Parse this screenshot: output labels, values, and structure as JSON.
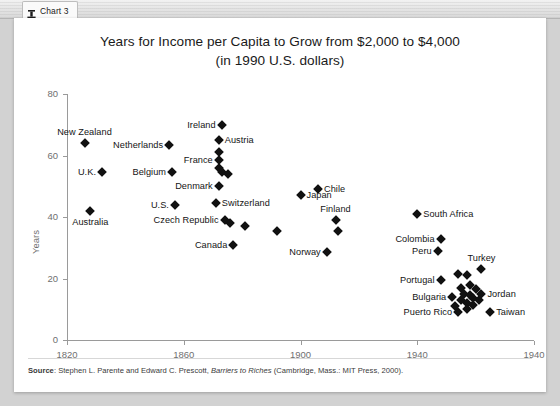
{
  "window": {
    "tab_label": "Chart 3",
    "tab_icon": "chart-icon"
  },
  "chart_data": {
    "type": "scatter",
    "title_line1": "Years for Income per Capita to Grow from $2,000 to $4,000",
    "title_line2": "(in 1990 U.S. dollars)",
    "xlabel": "",
    "ylabel": "Years",
    "xlim": [
      1820,
      1980
    ],
    "ylim": [
      0,
      80
    ],
    "xticks": [
      "1820",
      "1860",
      "1900",
      "1940",
      "1940"
    ],
    "xtick_values": [
      1820,
      1860,
      1900,
      1940,
      1980
    ],
    "yticks": [
      "0",
      "20",
      "40",
      "60",
      "80"
    ],
    "ytick_values": [
      0,
      20,
      40,
      60,
      80
    ],
    "grid": false,
    "legend": "none",
    "marker": "diamond",
    "marker_color": "#111111",
    "points": [
      {
        "name": "New Zealand",
        "x": 1826,
        "y": 64,
        "label_pos": "above"
      },
      {
        "name": "Netherlands",
        "x": 1855,
        "y": 63.5,
        "label_pos": "right"
      },
      {
        "name": "U.K.",
        "x": 1832,
        "y": 54.5,
        "label_pos": "right"
      },
      {
        "name": "Belgium",
        "x": 1856,
        "y": 54.5,
        "label_pos": "right"
      },
      {
        "name": "Australia",
        "x": 1828,
        "y": 42,
        "label_pos": "below"
      },
      {
        "name": "U.S.",
        "x": 1857,
        "y": 44,
        "label_pos": "right"
      },
      {
        "name": "Ireland",
        "x": 1873,
        "y": 70,
        "label_pos": "right"
      },
      {
        "name": "Austria",
        "x": 1872,
        "y": 65,
        "label_pos": "left"
      },
      {
        "name": "France",
        "x": 1872,
        "y": 58.5,
        "label_pos": "right"
      },
      {
        "name": "Denmark",
        "x": 1872,
        "y": 50,
        "label_pos": "right"
      },
      {
        "name": "Switzerland",
        "x": 1871,
        "y": 44.5,
        "label_pos": "left"
      },
      {
        "name": "Czech Republic",
        "x": 1874,
        "y": 39,
        "label_pos": "right"
      },
      {
        "name": "Canada",
        "x": 1877,
        "y": 31,
        "label_pos": "right"
      },
      {
        "name": "Japan",
        "x": 1900,
        "y": 47,
        "label_pos": "left"
      },
      {
        "name": "Chile",
        "x": 1906,
        "y": 49,
        "label_pos": "left"
      },
      {
        "name": "Finland",
        "x": 1912,
        "y": 39,
        "label_pos": "above"
      },
      {
        "name": "Norway",
        "x": 1909,
        "y": 28.5,
        "label_pos": "right"
      },
      {
        "name": "South Africa",
        "x": 1940,
        "y": 41,
        "label_pos": "left"
      },
      {
        "name": "Colombia",
        "x": 1948,
        "y": 33,
        "label_pos": "right"
      },
      {
        "name": "Peru",
        "x": 1947,
        "y": 29,
        "label_pos": "right"
      },
      {
        "name": "Turkey",
        "x": 1962,
        "y": 23,
        "label_pos": "above"
      },
      {
        "name": "Portugal",
        "x": 1948,
        "y": 19.5,
        "label_pos": "right"
      },
      {
        "name": "Bulgaria",
        "x": 1952,
        "y": 14,
        "label_pos": "right"
      },
      {
        "name": "Jordan",
        "x": 1962,
        "y": 15,
        "label_pos": "left"
      },
      {
        "name": "Puerto Rico",
        "x": 1954,
        "y": 9,
        "label_pos": "right"
      },
      {
        "name": "Taiwan",
        "x": 1965,
        "y": 9,
        "label_pos": "left"
      }
    ],
    "unlabeled_points": [
      {
        "x": 1872,
        "y": 61
      },
      {
        "x": 1872,
        "y": 56
      },
      {
        "x": 1873,
        "y": 54.5
      },
      {
        "x": 1875,
        "y": 54
      },
      {
        "x": 1876,
        "y": 38
      },
      {
        "x": 1881,
        "y": 37
      },
      {
        "x": 1892,
        "y": 35.5
      },
      {
        "x": 1913,
        "y": 35.5
      },
      {
        "x": 1954,
        "y": 21.5
      },
      {
        "x": 1957,
        "y": 21
      },
      {
        "x": 1955,
        "y": 17
      },
      {
        "x": 1958,
        "y": 18
      },
      {
        "x": 1960,
        "y": 16.5
      },
      {
        "x": 1956,
        "y": 15
      },
      {
        "x": 1958,
        "y": 14.5
      },
      {
        "x": 1959,
        "y": 13.5
      },
      {
        "x": 1955,
        "y": 13
      },
      {
        "x": 1957,
        "y": 12
      },
      {
        "x": 1959,
        "y": 11.5
      },
      {
        "x": 1961,
        "y": 13
      },
      {
        "x": 1953,
        "y": 11
      },
      {
        "x": 1957,
        "y": 10
      }
    ]
  },
  "footer": {
    "source_prefix": "Source",
    "source_text_1": ": Stephen L. Parente and Edward C. Prescott, ",
    "source_italic": "Barriers to Riches",
    "source_text_2": " (Cambridge, Mass.: MIT Press, 2000)."
  }
}
